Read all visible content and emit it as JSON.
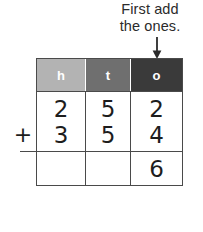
{
  "caption": {
    "line1": "First add",
    "line2": "the ones.",
    "arrow_icon": "arrow-down-icon",
    "arrow_target_column": "o"
  },
  "colors": {
    "hundreds_header_bg": "#b3b3b3",
    "tens_header_bg": "#6f6f6f",
    "ones_header_bg": "#3a3a3a",
    "header_text": "#ffffff",
    "border": "#4a4a4a",
    "digit_text": "#1d1d1d",
    "caption_text": "#2b2b2b"
  },
  "operator": {
    "symbol": "+"
  },
  "table": {
    "headers": [
      {
        "label": "h",
        "name": "hundreds"
      },
      {
        "label": "t",
        "name": "tens"
      },
      {
        "label": "o",
        "name": "ones"
      }
    ],
    "addend1": {
      "hundreds": "2",
      "tens": "5",
      "ones": "2"
    },
    "addend2": {
      "hundreds": "3",
      "tens": "5",
      "ones": "4"
    },
    "sum": {
      "hundreds": "",
      "tens": "",
      "ones": "6"
    }
  }
}
